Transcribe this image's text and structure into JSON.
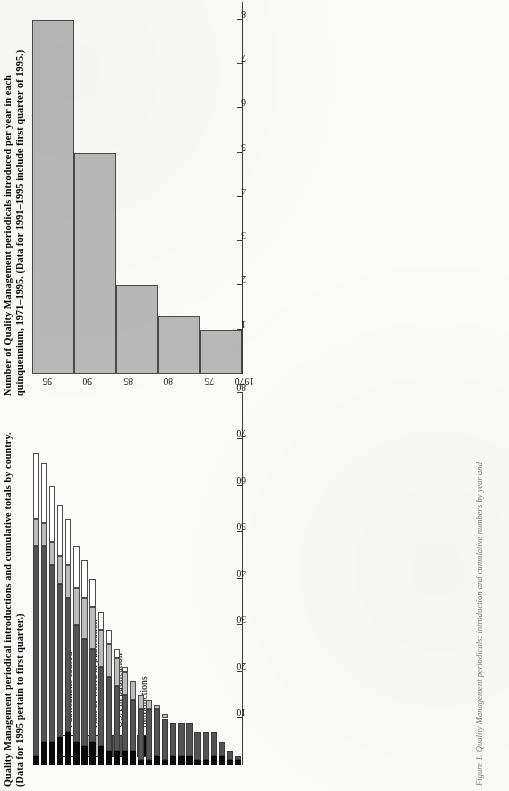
{
  "page": {
    "orientation": "rotated-90-ccw",
    "caption_fragment": "Figure 1. Quality Management periodicals: introduction and cumulative numbers by year and"
  },
  "top_chart": {
    "title_line1": "Number of Quality Management periodicals introduced per year in each",
    "title_line2": "quinquennium, 1971–1995. (Data for 1991–1995 include first quarter of 1995.)",
    "axis_labels": [
      "1",
      "2",
      "3",
      "4",
      "5",
      "6",
      "7",
      "8"
    ],
    "category_labels": [
      "1971–75",
      "1976–85",
      "1981–85",
      "1986–90",
      "1991–95"
    ]
  },
  "bottom_chart": {
    "title_line1": "Quality Management periodical introductions and cumulative totals by country.",
    "title_line2": "(Data for 1995 pertain to first quarter.)",
    "axis_labels": [
      "10",
      "20",
      "30",
      "40",
      "50",
      "60",
      "70",
      "80"
    ],
    "year_tick_labels": [
      "1970",
      "75",
      "80",
      "85",
      "90",
      "95"
    ],
    "legend": [
      {
        "label": "Publications ceased",
        "color": "#ffffff",
        "key": "ceased"
      },
      {
        "label": "Rest of world in publication",
        "color": "#bcbcbc",
        "key": "row"
      },
      {
        "label": "USA in publication",
        "color": "#545454",
        "key": "usa"
      },
      {
        "label": "Introductions",
        "color": "#0a0a0a",
        "key": "intro"
      }
    ]
  },
  "chart_data": [
    {
      "id": "quinquennium-introductions",
      "type": "bar",
      "orientation": "horizontal-on-page (vertical when upright)",
      "title": "Number of Quality Management periodicals introduced per year in each quinquennium, 1971–1995. (Data for 1991–1995 include first quarter of 1995.)",
      "xlabel": "",
      "ylabel": "",
      "categories": [
        "1971–75",
        "1976–85",
        "1981–85",
        "1986–90",
        "1991–95"
      ],
      "values": [
        1.0,
        1.3,
        2.0,
        5.0,
        8.0
      ],
      "ylim": [
        0,
        8.4
      ],
      "yticks": [
        1,
        2,
        3,
        4,
        5,
        6,
        7,
        8
      ],
      "grid": false,
      "legend": "none",
      "bar_color": "#b9b9b9"
    },
    {
      "id": "introductions-and-cumulative-totals",
      "type": "bar",
      "subtype": "stacked",
      "orientation": "horizontal-on-page (vertical when upright)",
      "title": "Quality Management periodical introductions and cumulative totals by country. (Data for 1995 pertain to first quarter.)",
      "xlabel": "",
      "ylabel": "",
      "categories": [
        "1970",
        "1971",
        "1972",
        "1973",
        "1974",
        "1975",
        "1976",
        "1977",
        "1978",
        "1979",
        "1980",
        "1981",
        "1982",
        "1983",
        "1984",
        "1985",
        "1986",
        "1987",
        "1988",
        "1989",
        "1990",
        "1991",
        "1992",
        "1993",
        "1994",
        "1995"
      ],
      "x_tick_labels": [
        "1970",
        "75",
        "80",
        "85",
        "90",
        "95"
      ],
      "ylim": [
        0,
        80
      ],
      "yticks": [
        10,
        20,
        30,
        40,
        50,
        60,
        70,
        80
      ],
      "grid": false,
      "legend_position": "left-middle",
      "series": [
        {
          "name": "Introductions",
          "color": "#0a0a0a",
          "values": [
            1,
            1,
            2,
            2,
            1,
            1,
            2,
            2,
            2,
            1,
            2,
            1,
            1,
            3,
            3,
            3,
            3,
            4,
            5,
            4,
            5,
            7,
            6,
            5,
            5,
            2
          ]
        },
        {
          "name": "USA in publication",
          "color": "#545454",
          "values": [
            1,
            2,
            3,
            5,
            6,
            6,
            7,
            7,
            7,
            9,
            10,
            11,
            11,
            11,
            12,
            14,
            16,
            17,
            20,
            23,
            25,
            29,
            33,
            38,
            42,
            45
          ]
        },
        {
          "name": "Rest of world in publication",
          "color": "#bcbcbc",
          "values": [
            0,
            0,
            0,
            0,
            0,
            0,
            0,
            0,
            0,
            1,
            1,
            2,
            3,
            4,
            5,
            6,
            7,
            8,
            9,
            9,
            8,
            7,
            6,
            5,
            5,
            6
          ]
        },
        {
          "name": "Publications ceased",
          "color": "#ffffff",
          "values": [
            0,
            0,
            0,
            0,
            0,
            0,
            0,
            0,
            0,
            0,
            0,
            0,
            0,
            0,
            1,
            2,
            3,
            4,
            6,
            8,
            9,
            10,
            11,
            12,
            13,
            14
          ]
        }
      ],
      "totals": [
        2,
        3,
        5,
        7,
        7,
        7,
        9,
        9,
        9,
        11,
        13,
        14,
        15,
        18,
        21,
        25,
        29,
        33,
        40,
        44,
        47,
        53,
        56,
        60,
        65,
        67
      ]
    }
  ]
}
